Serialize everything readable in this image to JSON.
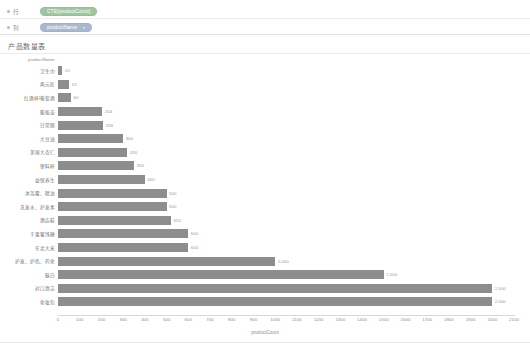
{
  "shelves": [
    {
      "axis_label": "行",
      "icon": "dot-icon",
      "fields": [
        {
          "label": "CTE(productCount)",
          "color": "#9ec6a0",
          "has_caret": false
        }
      ]
    },
    {
      "axis_label": "列",
      "icon": "dot-icon",
      "fields": [
        {
          "label": "productName",
          "color": "#a9b9cf",
          "has_caret": true,
          "caret": "▾"
        }
      ]
    }
  ],
  "title": "产品数量表",
  "chart_data": {
    "type": "bar",
    "orientation": "horizontal",
    "title": "产品数量表",
    "xlabel": "productCount",
    "ylabel": "productName",
    "xlim": [
      0,
      2100
    ],
    "xticks": [
      0,
      100,
      200,
      300,
      400,
      500,
      600,
      700,
      800,
      900,
      1000,
      1100,
      1200,
      1300,
      1400,
      1500,
      1600,
      1700,
      1800,
      1900,
      2000,
      2100
    ],
    "grid": false,
    "legend": "none",
    "bar_color": "#8d8d8d",
    "categories": [
      "卫生巾",
      "两元区",
      "红酒杯/葡萄酒",
      "暖瓶壶",
      "日常随",
      "大豆油",
      "美国大杏仁",
      "塑料杯",
      "益保养生",
      "沐浴露、精油",
      "洗发水、护发素",
      "酒店鞋",
      "干果蜜饯糖",
      "东北大米",
      "护发、护色、药化",
      "脑白",
      "对口清洁",
      "化妆包"
    ],
    "values": [
      20,
      52,
      60,
      204,
      208,
      300,
      320,
      350,
      400,
      500,
      500,
      520,
      600,
      600,
      1000,
      1500,
      2000,
      2000
    ],
    "value_labels": [
      "20",
      "52",
      "60",
      "204",
      "208",
      "300",
      "320",
      "350",
      "400",
      "500",
      "500",
      "520",
      "600",
      "600",
      "1,000",
      "1,500",
      "2,000",
      "2,000"
    ]
  }
}
